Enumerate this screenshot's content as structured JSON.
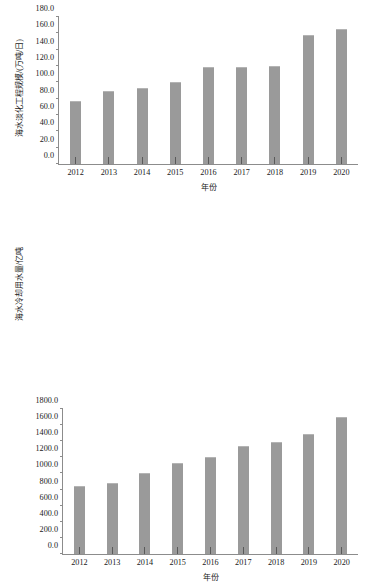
{
  "figure": {
    "background": "#ffffff",
    "bar_color": "#9a9a9a",
    "axis_color": "#8c8c8c",
    "text_color": "#1a1a1a"
  },
  "chart_data": [
    {
      "id": "desalination-capacity",
      "type": "bar",
      "title": "",
      "xlabel": "年份",
      "ylabel": "海水淡化工程规模/(万吨/日)",
      "categories": [
        "2012",
        "2013",
        "2014",
        "2015",
        "2016",
        "2017",
        "2018",
        "2019",
        "2020"
      ],
      "values": [
        77.0,
        90.0,
        92.7,
        101.0,
        118.8,
        118.9,
        120.2,
        157.4,
        165.1
      ],
      "ylim": [
        0.0,
        180.0
      ],
      "ytick_step": 20.0,
      "yticks": [
        "0.0",
        "20.0",
        "40.0",
        "60.0",
        "80.0",
        "100.0",
        "120.0",
        "140.0",
        "160.0",
        "180.0"
      ],
      "grid": false,
      "legend": "none"
    },
    {
      "id": "seawater-cooling-usage",
      "type": "bar",
      "title": "",
      "xlabel": "年份",
      "ylabel": "海水冷却用水量/亿吨",
      "categories": [
        "2012",
        "2013",
        "2014",
        "2015",
        "2016",
        "2017",
        "2018",
        "2019",
        "2020"
      ],
      "values": [
        840.0,
        883.0,
        1009.0,
        1125.0,
        1201.0,
        1344.0,
        1391.0,
        1486.0,
        1698.0
      ],
      "ylim": [
        0.0,
        1800.0
      ],
      "ytick_step": 200.0,
      "yticks": [
        "0.0",
        "200.0",
        "400.0",
        "600.0",
        "800.0",
        "1000.0",
        "1200.0",
        "1400.0",
        "1600.0",
        "1800.0"
      ],
      "grid": false,
      "legend": "none"
    }
  ]
}
